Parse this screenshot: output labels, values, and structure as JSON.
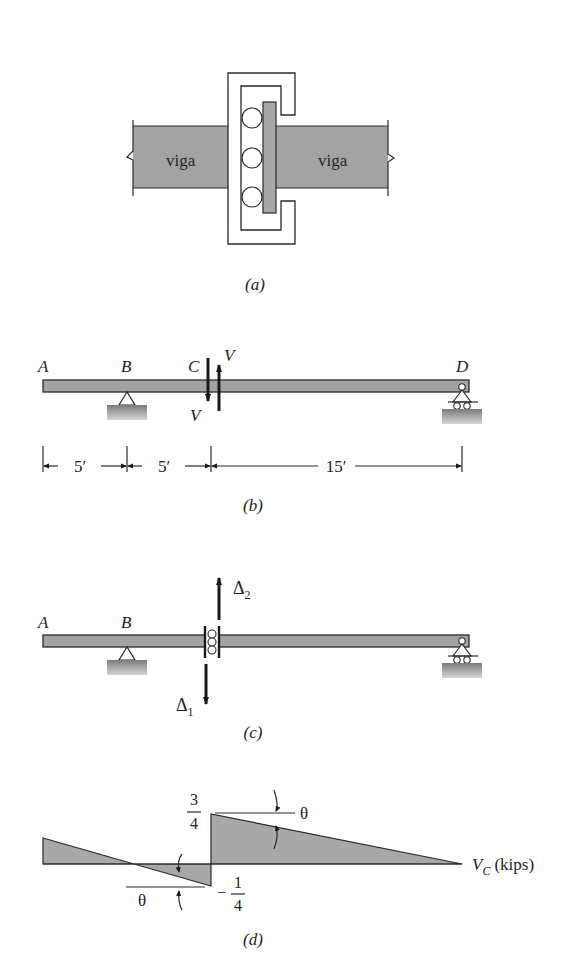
{
  "figure_a": {
    "beam_left_label": "viga",
    "beam_right_label": "viga",
    "caption": "(a)"
  },
  "figure_b": {
    "point_labels": {
      "A": "A",
      "B": "B",
      "C": "C",
      "D": "D"
    },
    "force_label_top": "V",
    "force_label_bottom": "V",
    "dimensions": [
      "5′",
      "5′",
      "15′"
    ],
    "caption": "(b)"
  },
  "figure_c": {
    "point_labels": {
      "A": "A",
      "B": "B"
    },
    "delta_up": "Δ",
    "delta_up_sub": "2",
    "delta_down": "Δ",
    "delta_down_sub": "1",
    "caption": "(c)"
  },
  "figure_d": {
    "top_value_num": "3",
    "top_value_den": "4",
    "bottom_value_sign": "−",
    "bottom_value_num": "1",
    "bottom_value_den": "4",
    "angle_label_top": "θ",
    "angle_label_bottom": "θ",
    "axis_label_main": "V",
    "axis_label_sub": "C",
    "axis_label_unit": "(kips)",
    "caption": "(d)"
  },
  "colors": {
    "member_fill": "#a3a3a3",
    "line": "#2a2a2a",
    "background": "#ffffff"
  }
}
